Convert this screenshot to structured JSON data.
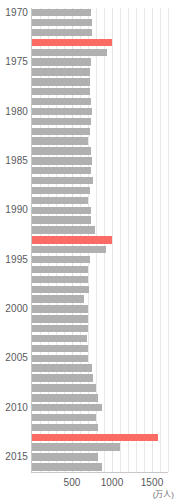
{
  "chart_data": {
    "type": "bar",
    "orientation": "horizontal",
    "title": "",
    "subtitle": "",
    "xlabel": "(万人)",
    "ylabel": "",
    "xlim": [
      0,
      1700
    ],
    "ylim": [
      1969.5,
      2016.5
    ],
    "grid": true,
    "legend_position": "none",
    "x_ticks": [
      500,
      1000,
      1500
    ],
    "x_tick_labels": [
      "500",
      "1000",
      "1500"
    ],
    "x_minor_ticks": [
      100,
      200,
      300,
      400,
      600,
      700,
      800,
      900,
      1100,
      1200,
      1300,
      1400,
      1600,
      1700
    ],
    "y_ticks": [
      1970,
      1975,
      1980,
      1985,
      1990,
      1995,
      2000,
      2005,
      2010,
      2015
    ],
    "y_tick_labels": [
      "1970",
      "1975",
      "1980",
      "1985",
      "1990",
      "1995",
      "2000",
      "2005",
      "2010",
      "2015"
    ],
    "unit_label": "(万人)",
    "bar_color": "#b0b0b0",
    "highlight_color": "#fa6b63",
    "gridline_color": "#e9e9e9",
    "axis_color": "#c8c8c8",
    "tick_label_color": "#59595b",
    "highlighted_categories": [
      1973,
      1993,
      2013
    ],
    "categories": [
      1970,
      1971,
      1972,
      1973,
      1974,
      1975,
      1976,
      1977,
      1978,
      1979,
      1980,
      1981,
      1982,
      1983,
      1984,
      1985,
      1986,
      1987,
      1988,
      1989,
      1990,
      1991,
      1992,
      1993,
      1994,
      1995,
      1996,
      1997,
      1998,
      1999,
      2000,
      2001,
      2002,
      2003,
      2004,
      2005,
      2006,
      2007,
      2008,
      2009,
      2010,
      2011,
      2012,
      2013,
      2014,
      2015,
      2016
    ],
    "values": [
      740,
      745,
      750,
      1000,
      940,
      735,
      730,
      725,
      730,
      735,
      745,
      740,
      720,
      700,
      735,
      745,
      740,
      760,
      720,
      700,
      735,
      740,
      790,
      1000,
      930,
      720,
      700,
      705,
      710,
      655,
      700,
      705,
      700,
      690,
      705,
      705,
      755,
      760,
      800,
      830,
      880,
      800,
      830,
      1570,
      1095,
      820,
      870
    ],
    "bars": [
      {
        "year": 1970,
        "value": 740,
        "highlight": false
      },
      {
        "year": 1971,
        "value": 745,
        "highlight": false
      },
      {
        "year": 1972,
        "value": 750,
        "highlight": false
      },
      {
        "year": 1973,
        "value": 1000,
        "highlight": true
      },
      {
        "year": 1974,
        "value": 940,
        "highlight": false
      },
      {
        "year": 1975,
        "value": 735,
        "highlight": false
      },
      {
        "year": 1976,
        "value": 730,
        "highlight": false
      },
      {
        "year": 1977,
        "value": 725,
        "highlight": false
      },
      {
        "year": 1978,
        "value": 730,
        "highlight": false
      },
      {
        "year": 1979,
        "value": 735,
        "highlight": false
      },
      {
        "year": 1980,
        "value": 745,
        "highlight": false
      },
      {
        "year": 1981,
        "value": 740,
        "highlight": false
      },
      {
        "year": 1982,
        "value": 720,
        "highlight": false
      },
      {
        "year": 1983,
        "value": 700,
        "highlight": false
      },
      {
        "year": 1984,
        "value": 735,
        "highlight": false
      },
      {
        "year": 1985,
        "value": 745,
        "highlight": false
      },
      {
        "year": 1986,
        "value": 740,
        "highlight": false
      },
      {
        "year": 1987,
        "value": 760,
        "highlight": false
      },
      {
        "year": 1988,
        "value": 720,
        "highlight": false
      },
      {
        "year": 1989,
        "value": 700,
        "highlight": false
      },
      {
        "year": 1990,
        "value": 735,
        "highlight": false
      },
      {
        "year": 1991,
        "value": 740,
        "highlight": false
      },
      {
        "year": 1992,
        "value": 790,
        "highlight": false
      },
      {
        "year": 1993,
        "value": 1000,
        "highlight": true
      },
      {
        "year": 1994,
        "value": 930,
        "highlight": false
      },
      {
        "year": 1995,
        "value": 720,
        "highlight": false
      },
      {
        "year": 1996,
        "value": 700,
        "highlight": false
      },
      {
        "year": 1997,
        "value": 705,
        "highlight": false
      },
      {
        "year": 1998,
        "value": 710,
        "highlight": false
      },
      {
        "year": 1999,
        "value": 655,
        "highlight": false
      },
      {
        "year": 2000,
        "value": 700,
        "highlight": false
      },
      {
        "year": 2001,
        "value": 705,
        "highlight": false
      },
      {
        "year": 2002,
        "value": 700,
        "highlight": false
      },
      {
        "year": 2003,
        "value": 690,
        "highlight": false
      },
      {
        "year": 2004,
        "value": 705,
        "highlight": false
      },
      {
        "year": 2005,
        "value": 705,
        "highlight": false
      },
      {
        "year": 2006,
        "value": 755,
        "highlight": false
      },
      {
        "year": 2007,
        "value": 760,
        "highlight": false
      },
      {
        "year": 2008,
        "value": 800,
        "highlight": false
      },
      {
        "year": 2009,
        "value": 830,
        "highlight": false
      },
      {
        "year": 2010,
        "value": 880,
        "highlight": false
      },
      {
        "year": 2011,
        "value": 800,
        "highlight": false
      },
      {
        "year": 2012,
        "value": 830,
        "highlight": false
      },
      {
        "year": 2013,
        "value": 1570,
        "highlight": true
      },
      {
        "year": 2014,
        "value": 1095,
        "highlight": false
      },
      {
        "year": 2015,
        "value": 820,
        "highlight": false
      },
      {
        "year": 2016,
        "value": 870,
        "highlight": false
      }
    ]
  }
}
